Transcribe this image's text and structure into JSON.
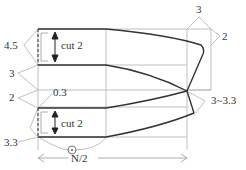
{
  "diagram": {
    "type": "sewing-pattern-draft",
    "colors": {
      "guide": "#b0b0b0",
      "outline": "#333333",
      "text": "#333333"
    },
    "labels": {
      "upper_height": "4.5",
      "upper_cut": "cut 2",
      "gap_upper": "3",
      "gap_lower": "2",
      "offset": "0.3",
      "lower_height": "3.3",
      "lower_cut": "cut 2",
      "top_width": "3",
      "top_right": "2",
      "tip_range": "3~3.3",
      "width": "N/2",
      "match_mark": "⊙"
    }
  }
}
